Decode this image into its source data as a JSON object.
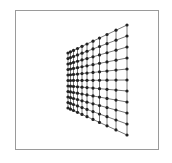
{
  "diagram": {
    "type": "perspective-grid-mesh",
    "frame": {
      "x": 15,
      "y": 10,
      "width": 144,
      "height": 140,
      "border_color": "#9a9a9a"
    },
    "grid": {
      "rows": 11,
      "cols": 11,
      "left_edge": {
        "x": 68,
        "y_top": 53,
        "y_bottom": 108
      },
      "right_edge": {
        "x": 127,
        "y_top": 25,
        "y_bottom": 135
      },
      "column_x": [
        68,
        70.5,
        73.5,
        77.5,
        82,
        87,
        93,
        99.5,
        107,
        116,
        127
      ],
      "line_color": "#555555",
      "node_color": "#222222",
      "node_radius": 1.6
    }
  }
}
